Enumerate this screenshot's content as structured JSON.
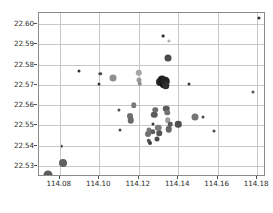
{
  "chart_data": {
    "type": "scatter",
    "title": "",
    "xlabel": "",
    "ylabel": "",
    "xlim": [
      114.0695,
      114.1845
    ],
    "ylim": [
      22.5245,
      22.6055
    ],
    "xticks": [
      114.08,
      114.1,
      114.12,
      114.14,
      114.16,
      114.18
    ],
    "xtick_labels": [
      "114.08",
      "114.10",
      "114.12",
      "114.14",
      "114.16",
      "114.18"
    ],
    "yticks": [
      22.53,
      22.54,
      22.55,
      22.56,
      22.57,
      22.58,
      22.59,
      22.6
    ],
    "ytick_labels": [
      "22.53",
      "22.54",
      "22.55",
      "22.56",
      "22.57",
      "22.58",
      "22.59",
      "22.60"
    ],
    "grid": true,
    "legend": null,
    "marker": "circle",
    "colormap": "grayscale",
    "size_encoding": "bubble area varies by value",
    "points": [
      {
        "x": 114.074,
        "y": 22.5255,
        "size": 9.0,
        "color": "#5a5a5a"
      },
      {
        "x": 114.0815,
        "y": 22.5315,
        "size": 8.0,
        "color": "#606060"
      },
      {
        "x": 114.081,
        "y": 22.5398,
        "size": 2.6,
        "color": "#4a4a4a"
      },
      {
        "x": 114.09,
        "y": 22.577,
        "size": 3.0,
        "color": "#303030"
      },
      {
        "x": 114.1,
        "y": 22.5702,
        "size": 3.0,
        "color": "#333333"
      },
      {
        "x": 114.1005,
        "y": 22.5755,
        "size": 3.4,
        "color": "#4d4d4d"
      },
      {
        "x": 114.107,
        "y": 22.5735,
        "size": 7.0,
        "color": "#8e8e8e"
      },
      {
        "x": 114.11,
        "y": 22.5575,
        "size": 3.2,
        "color": "#4f4f4f"
      },
      {
        "x": 114.1105,
        "y": 22.5478,
        "size": 3.0,
        "color": "#4a4a4a"
      },
      {
        "x": 114.1155,
        "y": 22.5548,
        "size": 6.0,
        "color": "#6e6e6e"
      },
      {
        "x": 114.116,
        "y": 22.5525,
        "size": 6.5,
        "color": "#6a6a6a"
      },
      {
        "x": 114.1175,
        "y": 22.56,
        "size": 5.5,
        "color": "#7a7a7a"
      },
      {
        "x": 114.12,
        "y": 22.576,
        "size": 6.5,
        "color": "#a6a6a6"
      },
      {
        "x": 114.1202,
        "y": 22.5722,
        "size": 5.0,
        "color": "#9a9a9a"
      },
      {
        "x": 114.1205,
        "y": 22.5705,
        "size": 4.5,
        "color": "#8a8a8a"
      },
      {
        "x": 114.1245,
        "y": 22.5455,
        "size": 6.0,
        "color": "#6f6f6f"
      },
      {
        "x": 114.125,
        "y": 22.5478,
        "size": 5.0,
        "color": "#787878"
      },
      {
        "x": 114.1252,
        "y": 22.5425,
        "size": 4.5,
        "color": "#565656"
      },
      {
        "x": 114.1258,
        "y": 22.5412,
        "size": 4.0,
        "color": "#3f3f3f"
      },
      {
        "x": 114.127,
        "y": 22.5468,
        "size": 5.5,
        "color": "#5e5e5e"
      },
      {
        "x": 114.1275,
        "y": 22.5508,
        "size": 3.0,
        "color": "#3a3a3a"
      },
      {
        "x": 114.128,
        "y": 22.5552,
        "size": 6.5,
        "color": "#5a5a5a"
      },
      {
        "x": 114.1285,
        "y": 22.5578,
        "size": 5.5,
        "color": "#6c6c6c"
      },
      {
        "x": 114.1292,
        "y": 22.5432,
        "size": 5.0,
        "color": "#4a4a4a"
      },
      {
        "x": 114.13,
        "y": 22.5488,
        "size": 6.5,
        "color": "#7d7d7d"
      },
      {
        "x": 114.1305,
        "y": 22.5462,
        "size": 5.5,
        "color": "#555555"
      },
      {
        "x": 114.131,
        "y": 22.5712,
        "size": 8.0,
        "color": "#2a2a2a"
      },
      {
        "x": 114.132,
        "y": 22.5722,
        "size": 9.0,
        "color": "#1f1f1f"
      },
      {
        "x": 114.1328,
        "y": 22.5705,
        "size": 9.5,
        "color": "#171717"
      },
      {
        "x": 114.1335,
        "y": 22.5718,
        "size": 8.5,
        "color": "#222222"
      },
      {
        "x": 114.1338,
        "y": 22.5698,
        "size": 7.5,
        "color": "#2e2e2e"
      },
      {
        "x": 114.1322,
        "y": 22.5942,
        "size": 2.8,
        "color": "#2b2b2b"
      },
      {
        "x": 114.1355,
        "y": 22.5918,
        "size": 3.2,
        "color": "#b0b0b0"
      },
      {
        "x": 114.1348,
        "y": 22.5833,
        "size": 7.0,
        "color": "#4a4a4a"
      },
      {
        "x": 114.134,
        "y": 22.5582,
        "size": 6.5,
        "color": "#5c5c5c"
      },
      {
        "x": 114.1345,
        "y": 22.5562,
        "size": 5.5,
        "color": "#737373"
      },
      {
        "x": 114.1348,
        "y": 22.5525,
        "size": 5.5,
        "color": "#9d9d9d"
      },
      {
        "x": 114.1352,
        "y": 22.5482,
        "size": 6.5,
        "color": "#666666"
      },
      {
        "x": 114.136,
        "y": 22.5505,
        "size": 4.5,
        "color": "#5a5a5a"
      },
      {
        "x": 114.14,
        "y": 22.5505,
        "size": 6.5,
        "color": "#4f4f4f"
      },
      {
        "x": 114.1455,
        "y": 22.5705,
        "size": 3.0,
        "color": "#3a3a3a"
      },
      {
        "x": 114.1485,
        "y": 22.554,
        "size": 7.0,
        "color": "#747474"
      },
      {
        "x": 114.1525,
        "y": 22.554,
        "size": 3.0,
        "color": "#4a4a4a"
      },
      {
        "x": 114.158,
        "y": 22.547,
        "size": 3.0,
        "color": "#4a4a4a"
      },
      {
        "x": 114.178,
        "y": 22.5665,
        "size": 3.0,
        "color": "#555555"
      },
      {
        "x": 114.181,
        "y": 22.603,
        "size": 3.0,
        "color": "#2e2e2e"
      }
    ]
  }
}
